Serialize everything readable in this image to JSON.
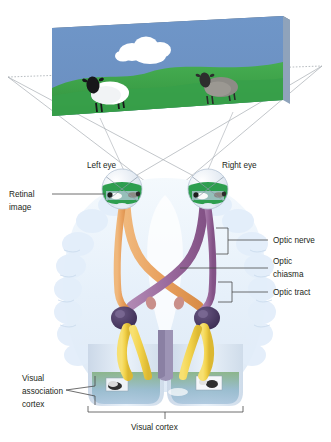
{
  "diagram": {
    "background_color": "#ffffff"
  },
  "scene_panel": {
    "name": "visual-scene-panel",
    "sky_color": "#6b92c4",
    "grass_color": "#3fa64a",
    "grass_dark_color": "#2f8f3c",
    "top_edge_color": "#5d6b78",
    "side_edge_color": "#8fa3bb",
    "cloud_color": "#ffffff",
    "objects": [
      {
        "name": "white-sheep",
        "body_color": "#ffffff",
        "head_color": "#1a1a1a"
      },
      {
        "name": "grey-sheep",
        "body_color": "#8d8b86",
        "head_color": "#2a2a2a"
      }
    ]
  },
  "sight_lines": {
    "name": "sight-lines",
    "color": "#9aa0a6",
    "dotted_color": "#9aa0a6"
  },
  "brain": {
    "name": "brain-outline",
    "fill": "#eef4fb",
    "gyri_color": "#dbe8f5",
    "stem_color": "#9d94b5"
  },
  "eyes": {
    "left": {
      "label": "Left eye",
      "name": "left-eye"
    },
    "right": {
      "label": "Right eye",
      "name": "right-eye"
    },
    "sclera_color": "#e9eef5",
    "retina_color": "#2e9e4f",
    "iris_color": "#b9cadd"
  },
  "pathways": {
    "left_tract_color": "#e8a05e",
    "right_tract_color": "#9b6b9e",
    "radiation_color": "#f2d24a",
    "lgn_color": "#4a3a63"
  },
  "labels": {
    "retinal_image": "Retinal\nimage",
    "retinal_image_line1": "Retinal",
    "retinal_image_line2": "image",
    "optic_nerve": "Optic nerve",
    "optic_chiasma_line1": "Optic",
    "optic_chiasma_line2": "chiasma",
    "optic_tract": "Optic tract",
    "visual_association_line1": "Visual",
    "visual_association_line2": "association",
    "visual_association_line3": "cortex",
    "visual_cortex": "Visual cortex",
    "leader_color": "#4a4a4a",
    "text_color": "#231f20"
  }
}
